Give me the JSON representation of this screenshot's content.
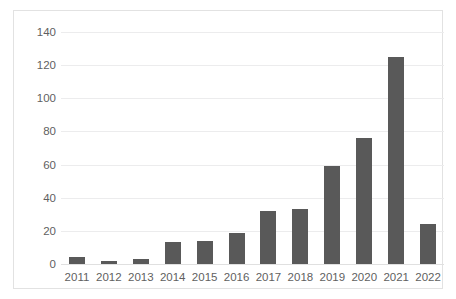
{
  "chart_data": {
    "type": "bar",
    "title": "",
    "subtitle": "",
    "xlabel": "",
    "ylabel": "",
    "categories": [
      "2011",
      "2012",
      "2013",
      "2014",
      "2015",
      "2016",
      "2017",
      "2018",
      "2019",
      "2020",
      "2021",
      "2022"
    ],
    "values": [
      4,
      2,
      3,
      13,
      14,
      19,
      32,
      33,
      59,
      76,
      125,
      24
    ],
    "ylim": [
      0,
      140
    ],
    "ytick_labels": [
      "140",
      "120",
      "100",
      "80",
      "60",
      "40",
      "20",
      "0"
    ],
    "ytick_values": [
      140,
      120,
      100,
      80,
      60,
      40,
      20,
      0
    ],
    "grid": true,
    "legend": false,
    "legend_position": "none",
    "series": [
      {
        "name": "",
        "values": [
          4,
          2,
          3,
          13,
          14,
          19,
          32,
          33,
          59,
          76,
          125,
          24
        ]
      }
    ],
    "colors": {
      "bar": "#595959",
      "gridline": "#ececed",
      "axis_text": "#5f5f5f",
      "frame_border": "#e2e2e2",
      "background": "#ffffff"
    }
  }
}
